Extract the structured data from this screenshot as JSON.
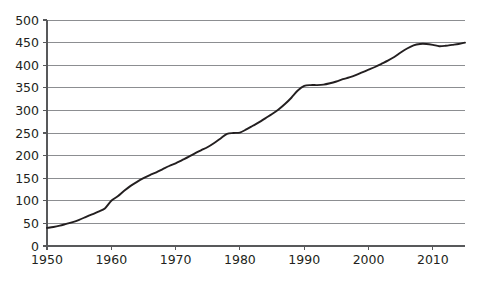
{
  "chart_data": {
    "type": "line",
    "title": "",
    "subtitle": "",
    "xlabel": "",
    "ylabel": "",
    "xlim": [
      1950,
      2015
    ],
    "ylim": [
      0,
      500
    ],
    "grid": true,
    "legend": null,
    "legend_position": "none",
    "line_color": "#231f20",
    "grid_color": "#808285",
    "axis_color": "#58595b",
    "text_color": "#231f20",
    "background": "#ffffff",
    "y_ticks": [
      0,
      50,
      100,
      150,
      200,
      250,
      300,
      350,
      400,
      450,
      500
    ],
    "y_tick_labels": [
      "0",
      "50",
      "100",
      "150",
      "200",
      "250",
      "300",
      "350",
      "400",
      "450",
      "500"
    ],
    "x_ticks": [
      1950,
      1960,
      1970,
      1980,
      1990,
      2000,
      2010
    ],
    "x_tick_labels": [
      "1950",
      "1960",
      "1970",
      "1980",
      "1990",
      "2000",
      "2010"
    ],
    "x_minor_step": 10,
    "series": [
      {
        "name": "series-1",
        "x": [
          1950,
          1951,
          1952,
          1953,
          1954,
          1955,
          1956,
          1957,
          1958,
          1959,
          1960,
          1961,
          1962,
          1963,
          1964,
          1965,
          1966,
          1967,
          1968,
          1969,
          1970,
          1971,
          1972,
          1973,
          1974,
          1975,
          1976,
          1977,
          1978,
          1979,
          1980,
          1981,
          1982,
          1983,
          1984,
          1985,
          1986,
          1987,
          1988,
          1989,
          1990,
          1991,
          1992,
          1993,
          1994,
          1995,
          1996,
          1997,
          1998,
          1999,
          2000,
          2001,
          2002,
          2003,
          2004,
          2005,
          2006,
          2007,
          2008,
          2009,
          2010,
          2011,
          2012,
          2013,
          2014,
          2015
        ],
        "y": [
          40,
          42,
          45,
          49,
          53,
          58,
          64,
          70,
          76,
          83,
          100,
          110,
          122,
          133,
          142,
          150,
          157,
          163,
          170,
          177,
          183,
          190,
          197,
          205,
          212,
          219,
          228,
          238,
          248,
          250,
          251,
          258,
          266,
          274,
          283,
          292,
          302,
          314,
          328,
          344,
          354,
          356,
          356,
          357,
          360,
          364,
          369,
          373,
          378,
          384,
          390,
          396,
          403,
          410,
          418,
          428,
          437,
          444,
          447,
          447,
          445,
          442,
          443,
          445,
          447,
          450
        ]
      }
    ]
  },
  "figure": {
    "plot_area": {
      "left": 47,
      "right": 465,
      "top": 20,
      "bottom": 246
    },
    "width": 478,
    "height": 281
  }
}
